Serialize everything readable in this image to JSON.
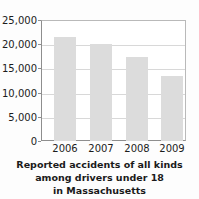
{
  "chart_data": {
    "type": "bar",
    "title": "",
    "caption_lines": [
      "Reported accidents of all kinds",
      "among drivers under 18",
      "in Massachusetts"
    ],
    "categories": [
      "2006",
      "2007",
      "2008",
      "2009"
    ],
    "values": [
      21500,
      20000,
      17350,
      13400
    ],
    "series": [
      {
        "name": "Reported accidents",
        "values": [
          21500,
          20000,
          17350,
          13400
        ]
      }
    ],
    "xlabel": "",
    "ylabel": "",
    "ylim": [
      0,
      25000
    ],
    "ytick_values": [
      0,
      5000,
      10000,
      15000,
      20000,
      25000
    ],
    "ytick_labels": [
      "0",
      "5,000",
      "10,000",
      "15,000",
      "20,000",
      "25,000"
    ],
    "grid": true,
    "grid_axis": "y",
    "legend": false,
    "legend_position": "none",
    "bar_color": "#dcdcdc",
    "axis_color": "#8e8e8e",
    "grid_color": "#d8d8d8",
    "text_color": "#1c1c1c",
    "background_color": "#ffffff"
  }
}
